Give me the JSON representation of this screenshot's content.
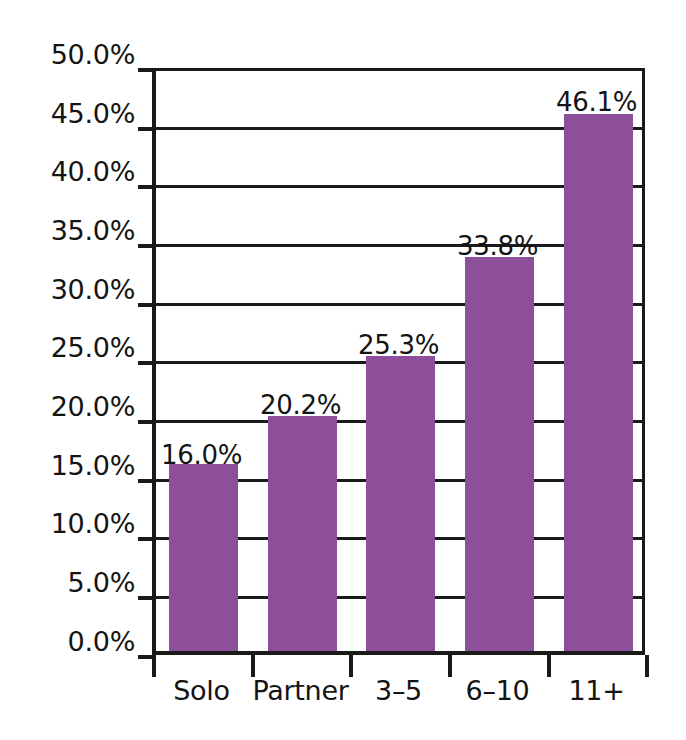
{
  "chart_data": {
    "type": "bar",
    "title": "",
    "subtitle": "",
    "xlabel": "",
    "ylabel": "",
    "categories": [
      "Solo",
      "Partner",
      "3–5",
      "6–10",
      "11+"
    ],
    "values": [
      16.0,
      20.2,
      25.3,
      33.8,
      46.1
    ],
    "value_labels": [
      "16.0%",
      "20.2%",
      "25.3%",
      "33.8%",
      "46.1%"
    ],
    "ylim": [
      0,
      50
    ],
    "ytick_values": [
      0,
      5,
      10,
      15,
      20,
      25,
      30,
      35,
      40,
      45,
      50
    ],
    "ytick_labels": [
      "0.0%",
      "5.0%",
      "10.0%",
      "15.0%",
      "20.0%",
      "25.0%",
      "30.0%",
      "35.0%",
      "40.0%",
      "45.0%",
      "50.0%"
    ],
    "grid": true,
    "grid_axis": "y",
    "legend": false,
    "legend_position": "none",
    "series": [
      {
        "name": "",
        "values": [
          16.0,
          20.2,
          25.3,
          33.8,
          46.1
        ],
        "color": "#8d4f99"
      }
    ]
  },
  "colors": {
    "bar": "#8d4f99",
    "axis": "#1a1a1a",
    "grid": "#1a1a1a",
    "text": "#141414",
    "background": "#ffffff"
  },
  "ytick_labels": {
    "0": "50.0%",
    "1": "45.0%",
    "2": "40.0%",
    "3": "35.0%",
    "4": "30.0%",
    "5": "25.0%",
    "6": "20.0%",
    "7": "15.0%",
    "8": "10.0%",
    "9": "5.0%",
    "10": "0.0%"
  },
  "xtick_labels": {
    "0": "Solo",
    "1": "Partner",
    "2": "3–5",
    "3": "6–10",
    "4": "11+"
  },
  "bar_value_labels": {
    "0": "16.0%",
    "1": "20.2%",
    "2": "25.3%",
    "3": "33.8%",
    "4": "46.1%"
  }
}
